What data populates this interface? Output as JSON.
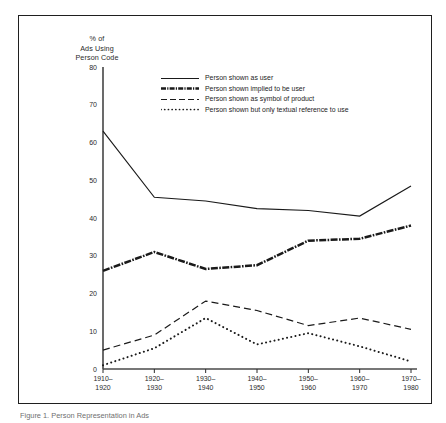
{
  "figure": {
    "caption": "Figure 1. Person Representation in Ads"
  },
  "chart_data": {
    "type": "line",
    "title": "",
    "ylabel_lines": [
      "% of",
      "Ads Using",
      "Person Code"
    ],
    "xlabel": "",
    "categories": [
      "1910-\n1920",
      "1920-\n1930",
      "1930-\n1940",
      "1940-\n1950",
      "1950-\n1960",
      "1960-\n1970",
      "1970-\n1980"
    ],
    "category_lines": [
      [
        "1910–",
        "1920"
      ],
      [
        "1920–",
        "1930"
      ],
      [
        "1930–",
        "1940"
      ],
      [
        "1940–",
        "1950"
      ],
      [
        "1950–",
        "1960"
      ],
      [
        "1960–",
        "1970"
      ],
      [
        "1970–",
        "1980"
      ]
    ],
    "ylim": [
      0,
      80
    ],
    "yticks": [
      0,
      10,
      20,
      30,
      40,
      50,
      60,
      70,
      80
    ],
    "ytick_labels": [
      "0",
      "10",
      "20",
      "30",
      "40",
      "50",
      "60",
      "70",
      "80"
    ],
    "grid": false,
    "legend_position": "upper-center",
    "series": [
      {
        "name": "Person shown as user",
        "style": "solid",
        "color": "#1a1a1a",
        "values": [
          63,
          45.5,
          44.5,
          42.5,
          42,
          40.5,
          48.5
        ]
      },
      {
        "name": "Person shown implied to be user",
        "style": "thick-dashdot",
        "color": "#1a1a1a",
        "values": [
          26,
          31,
          26.5,
          27.5,
          34,
          34.5,
          38
        ]
      },
      {
        "name": "Person shown as symbol of product",
        "style": "dashed",
        "color": "#1a1a1a",
        "values": [
          5,
          9,
          18,
          15.5,
          11.5,
          13.5,
          10.5
        ]
      },
      {
        "name": "Person shown but only textual reference to use",
        "style": "dotted",
        "color": "#1a1a1a",
        "values": [
          1,
          5.5,
          13.5,
          6.5,
          9.5,
          6,
          2
        ]
      }
    ]
  }
}
